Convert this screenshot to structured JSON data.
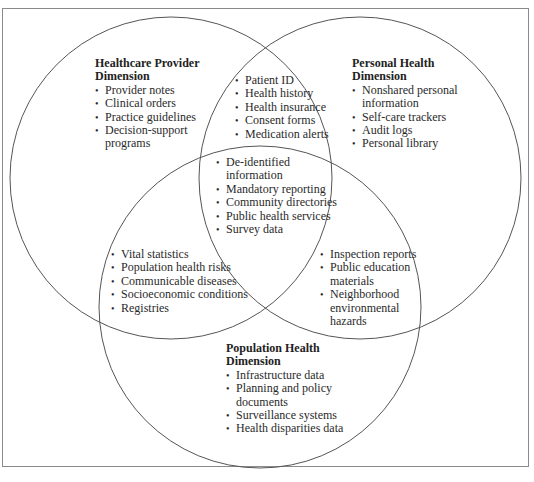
{
  "diagram": {
    "type": "venn",
    "sets": [
      {
        "id": "provider",
        "name": "Healthcare Provider Dimension"
      },
      {
        "id": "personal",
        "name": "Personal Health Dimension"
      },
      {
        "id": "population",
        "name": "Population Health Dimension"
      }
    ],
    "colors": {
      "line": "#555555",
      "frame": "#8a8a8a",
      "text": "#2a2a2a"
    }
  },
  "regions": {
    "provider_only": {
      "title_line1": "Healthcare Provider",
      "title_line2": "Dimension",
      "items": [
        "Provider notes",
        "Clinical orders",
        "Practice guidelines",
        "Decision-support\nprograms"
      ]
    },
    "personal_only": {
      "title_line1": "Personal Health",
      "title_line2": "Dimension",
      "items": [
        "Nonshared personal\ninformation",
        "Self-care trackers",
        "Audit logs",
        "Personal library"
      ]
    },
    "population_only": {
      "title_line1": "Population Health",
      "title_line2": "Dimension",
      "items": [
        "Infrastructure data",
        "Planning and policy\ndocuments",
        "Surveillance systems",
        "Health disparities data"
      ]
    },
    "provider_personal": {
      "items": [
        "Patient ID",
        "Health history",
        "Health insurance",
        "Consent forms",
        "Medication alerts"
      ]
    },
    "all_three": {
      "items": [
        "De-identified\ninformation",
        "Mandatory reporting",
        "Community directories",
        "Public health services",
        "Survey data"
      ]
    },
    "provider_population": {
      "items": [
        "Vital statistics",
        "Population health risks",
        "Communicable diseases",
        "Socioeconomic conditions",
        "Registries"
      ]
    },
    "personal_population": {
      "items": [
        "Inspection reports",
        "Public education\nmaterials",
        "Neighborhood\nenvironmental\nhazards"
      ]
    }
  },
  "bullet_glyph": "•"
}
